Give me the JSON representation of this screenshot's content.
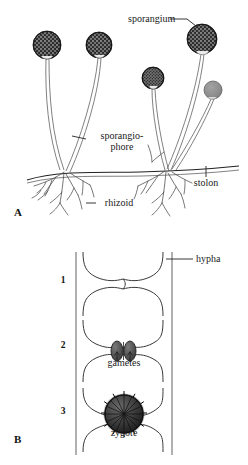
{
  "figure": {
    "caption_present": false,
    "panels": [
      {
        "id": "A",
        "letter": "A",
        "subject": "asexual structures of bread mold (Rhizopus)",
        "labels": [
          {
            "key": "sporangium",
            "text": "sporangium",
            "x": 128,
            "y": 22,
            "anchor": "start"
          },
          {
            "key": "sporangiophore_line1",
            "text": "sporangio-",
            "x": 122,
            "y": 139,
            "anchor": "middle"
          },
          {
            "key": "sporangiophore_line2",
            "text": "phore",
            "x": 122,
            "y": 150,
            "anchor": "middle"
          },
          {
            "key": "stolon",
            "text": "stolon",
            "x": 206,
            "y": 186,
            "anchor": "middle"
          },
          {
            "key": "rhizoid",
            "text": "rhizoid",
            "x": 119,
            "y": 206,
            "anchor": "middle"
          }
        ],
        "sporangia": [
          {
            "name": "sporangium-1",
            "cx": 47,
            "cy": 45,
            "r": 14,
            "shade": "dark",
            "mature": true
          },
          {
            "name": "sporangium-2",
            "cx": 99,
            "cy": 45,
            "r": 13,
            "shade": "dark",
            "mature": true
          },
          {
            "name": "sporangium-3",
            "cx": 202,
            "cy": 39,
            "r": 15,
            "shade": "dark",
            "mature": true
          },
          {
            "name": "sporangium-4",
            "cx": 153,
            "cy": 78,
            "r": 11,
            "shade": "dark",
            "mature": true
          },
          {
            "name": "sporangium-5",
            "cx": 213,
            "cy": 90,
            "r": 9,
            "shade": "light",
            "mature": false
          }
        ],
        "rhizoid_nodes": [
          {
            "name": "rhizoid-node-left",
            "x": 65,
            "y": 173
          },
          {
            "name": "rhizoid-node-right",
            "x": 166,
            "y": 172
          }
        ],
        "stolon": {
          "name": "stolon-line",
          "x1": 28,
          "y1": 178,
          "x2": 238,
          "y2": 167
        }
      },
      {
        "id": "B",
        "letter": "B",
        "subject": "sexual reproduction: conjugation of hyphae forming a zygote",
        "labels": [
          {
            "key": "hypha",
            "text": "hypha",
            "x": 196,
            "y": 262,
            "anchor": "start"
          },
          {
            "key": "gametes",
            "text": "gametes",
            "x": 124,
            "y": 366,
            "anchor": "middle"
          },
          {
            "key": "zygote",
            "text": "zygote",
            "x": 124,
            "y": 436,
            "anchor": "middle"
          }
        ],
        "stages": [
          {
            "number": "1",
            "label_x": 63,
            "label_y": 283,
            "description": "hyphal tips swell and touch"
          },
          {
            "number": "2",
            "label_x": 63,
            "label_y": 348,
            "description": "dark gametes form at contact point"
          },
          {
            "number": "3",
            "label_x": 63,
            "label_y": 414,
            "description": "spiny zygote develops"
          }
        ]
      }
    ],
    "panel_letters": [
      {
        "key": "A",
        "text": "A",
        "x": 14,
        "y": 216
      },
      {
        "key": "B",
        "text": "B",
        "x": 14,
        "y": 443
      }
    ],
    "colors": {
      "background": "#ffffff",
      "ink": "#1a1a1a",
      "sporangium_dark": "#2b2b2b",
      "sporangium_light": "#8a8a8a",
      "hypha_wall": "#6f6f6f",
      "gamete": "#4a4a4a",
      "zygote": "#333333"
    }
  }
}
